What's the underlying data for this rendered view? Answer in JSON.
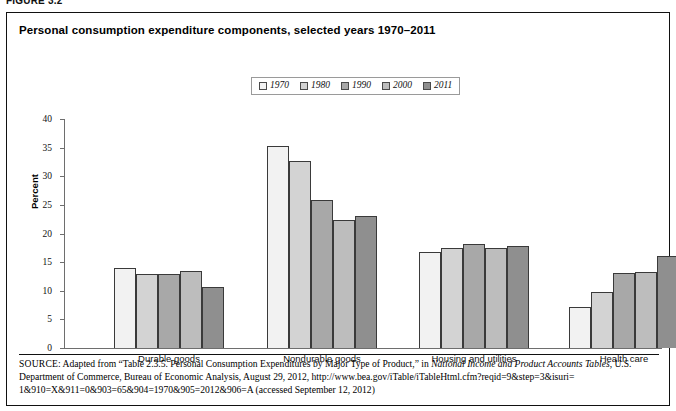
{
  "figure": {
    "label": "FIGURE 3.2"
  },
  "chart": {
    "title": "Personal consumption expenditure components, selected years 1970–2011",
    "ylabel": "Percent"
  },
  "legend": {
    "items": [
      {
        "label": "1970",
        "color": "#f2f2f2"
      },
      {
        "label": "1980",
        "color": "#d3d3d3"
      },
      {
        "label": "1990",
        "color": "#a8a8a8"
      },
      {
        "label": "2000",
        "color": "#bdbdbd"
      },
      {
        "label": "2011",
        "color": "#8f8f8f"
      }
    ]
  },
  "source": {
    "prefix": "SOURCE",
    "line1_a": ": Adapted from “Table 2.3.5. Personal Consumption Expenditures by Major Type of Product,” in ",
    "line1_italic": "National Income and Product Accounts Tables",
    "line1_b": ",",
    "line2": "U.S. Department of Commerce, Bureau of Economic Analysis, August 29, 2012, http://www.bea.gov/iTable/iTableHtml.cfm?reqid=9&step=3&isuri=",
    "line3": "1&910=X&911=0&903=65&904=1970&905=2012&906=A (accessed September 12, 2012)"
  },
  "chart_data": {
    "type": "bar",
    "title": "Personal consumption expenditure components, selected years 1970–2011",
    "xlabel": "",
    "ylabel": "Percent",
    "ylim": [
      0,
      40
    ],
    "yticks": [
      0,
      5,
      10,
      15,
      20,
      25,
      30,
      35,
      40
    ],
    "grid": false,
    "legend_position": "top-center",
    "categories": [
      "Durable goods",
      "Nondurable goods",
      "Housing and utilities",
      "Health care"
    ],
    "series": [
      {
        "name": "1970",
        "color": "#f2f2f2",
        "values": [
          13.9,
          35.2,
          16.8,
          7.2
        ]
      },
      {
        "name": "1980",
        "color": "#d3d3d3",
        "values": [
          12.9,
          32.6,
          17.5,
          9.7
        ]
      },
      {
        "name": "1990",
        "color": "#a8a8a8",
        "values": [
          12.9,
          25.8,
          18.1,
          13.1
        ]
      },
      {
        "name": "2000",
        "color": "#bdbdbd",
        "values": [
          13.4,
          22.3,
          17.4,
          13.3
        ]
      },
      {
        "name": "2011",
        "color": "#8f8f8f",
        "values": [
          10.6,
          23.0,
          17.8,
          16.1
        ]
      }
    ]
  }
}
